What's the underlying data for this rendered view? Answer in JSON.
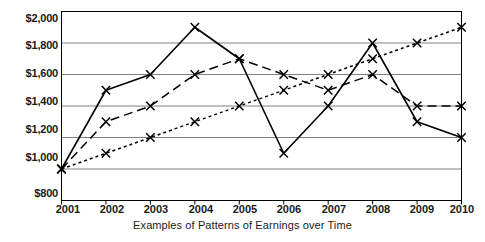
{
  "chart_data": {
    "type": "line",
    "title": "",
    "xlabel": "Examples of Patterns of Earnings over Time",
    "ylabel": "",
    "categories": [
      "2001",
      "2002",
      "2003",
      "2004",
      "2005",
      "2006",
      "2007",
      "2008",
      "2009",
      "2010"
    ],
    "x": [
      2001,
      2002,
      2003,
      2004,
      2005,
      2006,
      2007,
      2008,
      2009,
      2010
    ],
    "ylim": [
      800,
      2000
    ],
    "ytick_values": [
      800,
      1000,
      1200,
      1400,
      1600,
      1800,
      2000
    ],
    "ytick_labels": [
      "$800",
      "$1,000",
      "$1,200",
      "$1,400",
      "$1,600",
      "$1,800",
      "$2,000"
    ],
    "xtick_labels": [
      "2001",
      "2002",
      "2003",
      "2004",
      "2005",
      "2006",
      "2007",
      "2008",
      "2009",
      "2010"
    ],
    "grid": "horizontal",
    "legend": "none",
    "marker": "x",
    "series": [
      {
        "name": "Volatile earnings",
        "style": "solid",
        "color": "#000000",
        "values": [
          1000,
          1500,
          1600,
          1900,
          1700,
          1100,
          1400,
          1800,
          1300,
          1200
        ]
      },
      {
        "name": "Rise then plateau earnings",
        "style": "dashed",
        "color": "#000000",
        "values": [
          1000,
          1300,
          1400,
          1600,
          1700,
          1600,
          1500,
          1600,
          1400,
          1400
        ]
      },
      {
        "name": "Steady rising earnings",
        "style": "dotted",
        "color": "#000000",
        "values": [
          1000,
          1100,
          1200,
          1300,
          1400,
          1500,
          1600,
          1700,
          1800,
          1900
        ]
      }
    ]
  },
  "axis": {
    "ytick_labels": [
      "$2,000",
      "$1,800",
      "$1,600",
      "$1,400",
      "$1,200",
      "$1,000",
      "$800"
    ],
    "xtick_labels": [
      "2001",
      "2002",
      "2003",
      "2004",
      "2005",
      "2006",
      "2007",
      "2008",
      "2009",
      "2010"
    ],
    "xaxis_title": "Examples of Patterns of Earnings over Time"
  },
  "colors": {
    "axis": "#000000",
    "grid": "#808080",
    "series": "#000000",
    "background": "#ffffff"
  }
}
